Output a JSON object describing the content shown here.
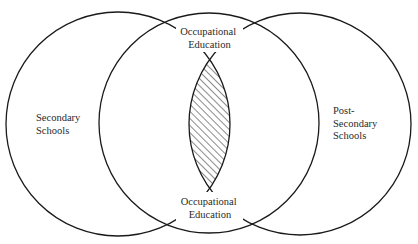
{
  "diagram": {
    "type": "venn",
    "circles": [
      {
        "id": "secondary",
        "label_lines": [
          "Secondary",
          "Schools"
        ],
        "cx": 118,
        "cy": 124,
        "r": 112
      },
      {
        "id": "middle",
        "label_lines": [],
        "cx": 209,
        "cy": 123,
        "r": 110
      },
      {
        "id": "post-secondary",
        "label_lines": [
          "Post-",
          "Secondary",
          "Schools"
        ],
        "cx": 300,
        "cy": 124,
        "r": 111
      }
    ],
    "overlap": {
      "description": "Hatched lens where Secondary Schools and Post-Secondary Schools overlap",
      "fill": "diagonal hatch"
    },
    "labels": {
      "secondary": {
        "line1": "Secondary",
        "line2": "Schools"
      },
      "post_secondary": {
        "line1": "Post-",
        "line2": "Secondary",
        "line3": "Schools"
      },
      "occupational_top": {
        "line1": "Occupational",
        "line2": "Education"
      },
      "occupational_bottom": {
        "line1": "Occupational",
        "line2": "Education"
      }
    },
    "colors": {
      "stroke": "#1a1a1a",
      "text": "#2a2a2a",
      "background": "#ffffff"
    }
  }
}
